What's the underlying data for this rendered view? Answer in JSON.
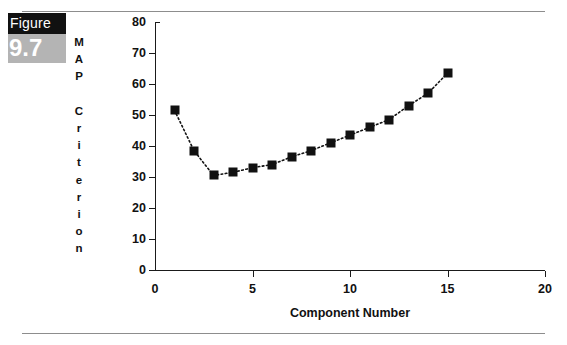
{
  "figure": {
    "word": "Figure",
    "number": "9.7"
  },
  "chart_data": {
    "type": "line",
    "title": "",
    "xlabel": "Component Number",
    "ylabel": "MAP Criterion",
    "ylabel_vertical": "M\nA\nP\n\nC\nr\ni\nt\ne\nr\ni\no\nn",
    "xlim": [
      0,
      20
    ],
    "ylim": [
      0,
      80
    ],
    "xticks": [
      0,
      5,
      10,
      15,
      20
    ],
    "yticks": [
      0,
      10,
      20,
      30,
      40,
      50,
      60,
      70,
      80
    ],
    "grid": false,
    "legend": null,
    "marker": "filled-square",
    "linestyle": "dotted",
    "color": "#111111",
    "x": [
      1,
      2,
      3,
      4,
      5,
      6,
      7,
      8,
      9,
      10,
      11,
      12,
      13,
      14,
      15
    ],
    "values": [
      51.5,
      38.5,
      30.5,
      31.5,
      33.0,
      34.0,
      36.5,
      38.5,
      41.0,
      43.5,
      46.0,
      48.5,
      53.0,
      57.0,
      63.5
    ],
    "series": [
      {
        "name": "MAP Criterion",
        "values": [
          51.5,
          38.5,
          30.5,
          31.5,
          33.0,
          34.0,
          36.5,
          38.5,
          41.0,
          43.5,
          46.0,
          48.5,
          53.0,
          57.0,
          63.5
        ]
      }
    ]
  }
}
